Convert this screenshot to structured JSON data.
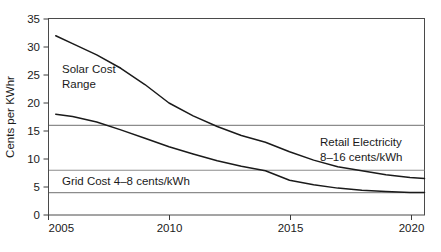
{
  "chart_data": {
    "type": "line",
    "title": "",
    "xlabel": "",
    "ylabel": "Cents per KWhr",
    "xlim": [
      2005,
      2020.6
    ],
    "ylim": [
      0,
      35
    ],
    "grid": false,
    "legend_position": "none",
    "x_ticks": [
      "2005",
      "2010",
      "2015",
      "2020"
    ],
    "x_tick_values": [
      2005,
      2010,
      2015,
      2020
    ],
    "y_ticks": [
      "0",
      "5",
      "10",
      "15",
      "20",
      "25",
      "30",
      "35"
    ],
    "y_tick_values": [
      0,
      5,
      10,
      15,
      20,
      25,
      30,
      35
    ],
    "series": [
      {
        "name": "Solar Cost Range (upper bound)",
        "color": "#1a1a1a",
        "x": [
          2005.3,
          2006,
          2007,
          2008,
          2009,
          2010,
          2011,
          2012,
          2013,
          2014,
          2015,
          2016,
          2017,
          2018,
          2019,
          2020,
          2020.6
        ],
        "values": [
          32.0,
          30.6,
          28.6,
          26.2,
          23.3,
          20.0,
          17.7,
          15.8,
          14.2,
          13.0,
          11.3,
          9.8,
          8.6,
          7.9,
          7.2,
          6.7,
          6.5
        ]
      },
      {
        "name": "Solar Cost Range (lower bound)",
        "color": "#1a1a1a",
        "x": [
          2005.3,
          2006,
          2007,
          2008,
          2009,
          2010,
          2011,
          2012,
          2013,
          2014,
          2015,
          2016,
          2017,
          2018,
          2019,
          2020,
          2020.6
        ],
        "values": [
          18.0,
          17.6,
          16.6,
          15.2,
          13.7,
          12.2,
          10.9,
          9.7,
          8.7,
          7.9,
          6.2,
          5.4,
          4.8,
          4.4,
          4.2,
          4.0,
          4.0
        ]
      }
    ],
    "reference_lines": [
      {
        "name": "retail-electricity-upper",
        "value": 16,
        "color": "#8c8c8c"
      },
      {
        "name": "retail-electricity-lower-grid-cost-upper",
        "value": 8,
        "color": "#8c8c8c"
      },
      {
        "name": "grid-cost-lower",
        "value": 4,
        "color": "#8c8c8c"
      }
    ],
    "annotations": [
      {
        "name": "solar-cost-range-label",
        "lines": [
          "Solar Cost",
          "Range"
        ],
        "x": 2005.6,
        "y": 25.2
      },
      {
        "name": "grid-cost-label",
        "lines": [
          "Grid Cost 4–8 cents/kWh"
        ],
        "x": 2005.6,
        "y": 6.0
      },
      {
        "name": "retail-electricity-label",
        "lines": [
          "Retail Electricity",
          "8–16 cents/kWh"
        ],
        "x": 2016.0,
        "y": 12.8
      }
    ]
  },
  "axis": {
    "y_title": "Cents per KWhr",
    "y_tick_0": "0",
    "y_tick_5": "5",
    "y_tick_10": "10",
    "y_tick_15": "15",
    "y_tick_20": "20",
    "y_tick_25": "25",
    "y_tick_30": "30",
    "y_tick_35": "35",
    "x_tick_2005": "2005",
    "x_tick_2010": "2010",
    "x_tick_2015": "2015",
    "x_tick_2020": "2020"
  },
  "labels": {
    "solar_line1": "Solar Cost",
    "solar_line2": "Range",
    "grid_cost": "Grid Cost 4–8 cents/kWh",
    "retail_line1": "Retail Electricity",
    "retail_line2": "8–16 cents/kWh"
  },
  "colors": {
    "curve": "#1a1a1a",
    "reference_line": "#8c8c8c",
    "axis": "#3a3a3a",
    "text": "#1a1a1a",
    "background": "#ffffff"
  }
}
